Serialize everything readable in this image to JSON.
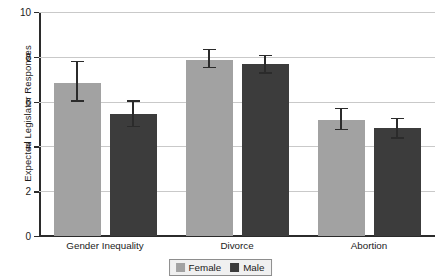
{
  "chart_data": {
    "type": "bar",
    "title": "",
    "subtitle": "",
    "xlabel": "",
    "ylabel": "Expected Legislator Responses",
    "categories": [
      "Gender Inequality",
      "Divorce",
      "Abortion"
    ],
    "ylim": [
      0,
      10
    ],
    "yticks": [
      0,
      2,
      4,
      6,
      8,
      10
    ],
    "ytick_labels": [
      "0",
      "2",
      "4",
      "6",
      "8",
      "10"
    ],
    "grid": "horizontal",
    "legend_position": "bottom-center",
    "series": [
      {
        "name": "Female",
        "color": "#a2a2a2",
        "values": [
          6.85,
          7.88,
          5.2
        ],
        "error_low": [
          6.0,
          7.48,
          4.73
        ],
        "error_high": [
          7.82,
          8.35,
          5.72
        ]
      },
      {
        "name": "Male",
        "color": "#3c3c3c",
        "values": [
          5.45,
          7.67,
          4.83
        ],
        "error_low": [
          4.85,
          7.25,
          4.35
        ],
        "error_high": [
          6.05,
          8.08,
          5.28
        ]
      }
    ],
    "error_bar_style": "capped-range",
    "annotations": []
  },
  "legend": {
    "entries": [
      {
        "label": "Female",
        "color": "#a2a2a2"
      },
      {
        "label": "Male",
        "color": "#3c3c3c"
      }
    ]
  },
  "colors": {
    "background": "#ffffff",
    "axis": "#2b2b2b",
    "grid": "#c9c9c9",
    "text": "#1b1b1b",
    "female": "#a2a2a2",
    "male": "#3c3c3c",
    "legend_background": "#f0f0f0",
    "legend_border": "#8d8d8d"
  }
}
